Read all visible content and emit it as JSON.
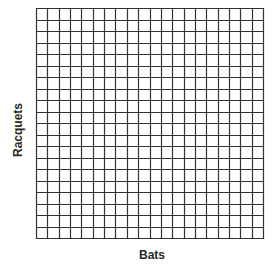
{
  "chart_data": {
    "type": "grid",
    "title": "",
    "xlabel": "Bats",
    "ylabel": "Racquets",
    "columns": 20,
    "rows": 20,
    "grid": true,
    "series": [],
    "line_color": "#333333",
    "background": "#ffffff"
  }
}
